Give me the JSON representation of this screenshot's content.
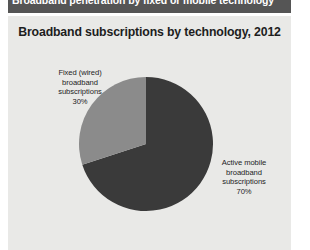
{
  "banner": {
    "caption": "Broadband penetration by fixed or mobile technology"
  },
  "panel": {
    "title": "Broadband subscriptions by technology, 2012"
  },
  "labels": {
    "fixed": {
      "line1": "Fixed (wired)",
      "line2": "broadband",
      "line3": "subscriptions",
      "line4": "30%"
    },
    "mobile": {
      "line1": "Active mobile",
      "line2": "broadband",
      "line3": "subscriptions",
      "line4": "70%"
    }
  },
  "colors": {
    "banner_bg": "#555555",
    "panel_bg": "#e9e9e7",
    "slice_mobile": "#3a3a3a",
    "slice_fixed": "#8b8b8b",
    "text": "#1d1d1d"
  },
  "chart_data": {
    "type": "pie",
    "title": "Broadband subscriptions by technology, 2012",
    "categories": [
      "Active mobile broadband subscriptions",
      "Fixed (wired) broadband subscriptions"
    ],
    "values": [
      70,
      30
    ],
    "unit": "%",
    "labels": [
      "70%",
      "30%"
    ],
    "slice_colors": [
      "#3a3a3a",
      "#8b8b8b"
    ],
    "start_angle_deg": 0,
    "direction": "clockwise",
    "legend": "annotated-callouts",
    "grid": false,
    "year": 2012
  }
}
